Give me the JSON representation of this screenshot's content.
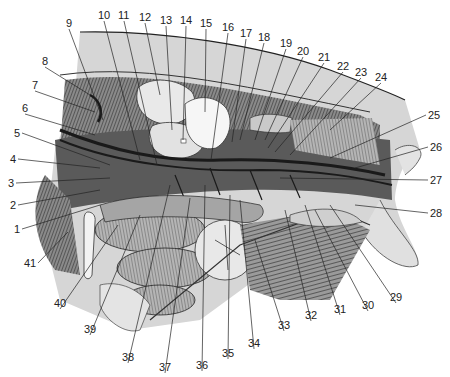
{
  "figure": {
    "type": "anatomical-illustration",
    "labels": [
      {
        "num": "1",
        "x": 14,
        "y": 224,
        "tx": 100,
        "ty": 205
      },
      {
        "num": "2",
        "x": 10,
        "y": 200,
        "tx": 100,
        "ty": 190
      },
      {
        "num": "3",
        "x": 8,
        "y": 178,
        "tx": 110,
        "ty": 178
      },
      {
        "num": "4",
        "x": 10,
        "y": 154,
        "tx": 100,
        "ty": 168
      },
      {
        "num": "5",
        "x": 14,
        "y": 128,
        "tx": 110,
        "ty": 165
      },
      {
        "num": "6",
        "x": 22,
        "y": 103,
        "tx": 95,
        "ty": 135
      },
      {
        "num": "7",
        "x": 32,
        "y": 80,
        "tx": 95,
        "ty": 112
      },
      {
        "num": "8",
        "x": 42,
        "y": 56,
        "tx": 90,
        "ty": 95
      },
      {
        "num": "9",
        "x": 66,
        "y": 18,
        "tx": 103,
        "ty": 120
      },
      {
        "num": "10",
        "x": 98,
        "y": 10,
        "tx": 140,
        "ty": 160
      },
      {
        "num": "11",
        "x": 118,
        "y": 10,
        "tx": 157,
        "ty": 165
      },
      {
        "num": "12",
        "x": 139,
        "y": 12,
        "tx": 160,
        "ty": 95
      },
      {
        "num": "13",
        "x": 160,
        "y": 15,
        "tx": 172,
        "ty": 130
      },
      {
        "num": "14",
        "x": 180,
        "y": 15,
        "tx": 183,
        "ty": 140
      },
      {
        "num": "15",
        "x": 200,
        "y": 18,
        "tx": 205,
        "ty": 112
      },
      {
        "num": "16",
        "x": 222,
        "y": 22,
        "tx": 211,
        "ty": 160
      },
      {
        "num": "17",
        "x": 240,
        "y": 28,
        "tx": 232,
        "ty": 142
      },
      {
        "num": "18",
        "x": 258,
        "y": 32,
        "tx": 240,
        "ty": 140
      },
      {
        "num": "19",
        "x": 280,
        "y": 38,
        "tx": 255,
        "ty": 140
      },
      {
        "num": "20",
        "x": 297,
        "y": 46,
        "tx": 265,
        "ty": 140
      },
      {
        "num": "21",
        "x": 318,
        "y": 52,
        "tx": 268,
        "ty": 148
      },
      {
        "num": "22",
        "x": 337,
        "y": 61,
        "tx": 275,
        "ty": 152
      },
      {
        "num": "23",
        "x": 355,
        "y": 67,
        "tx": 290,
        "ty": 155
      },
      {
        "num": "24",
        "x": 375,
        "y": 72,
        "tx": 330,
        "ty": 130
      },
      {
        "num": "25",
        "x": 428,
        "y": 110,
        "tx": 330,
        "ty": 158
      },
      {
        "num": "26",
        "x": 430,
        "y": 142,
        "tx": 355,
        "ty": 168
      },
      {
        "num": "27",
        "x": 430,
        "y": 175,
        "tx": 280,
        "ty": 178
      },
      {
        "num": "28",
        "x": 430,
        "y": 208,
        "tx": 355,
        "ty": 205
      },
      {
        "num": "29",
        "x": 390,
        "y": 292,
        "tx": 330,
        "ty": 205
      },
      {
        "num": "30",
        "x": 362,
        "y": 300,
        "tx": 315,
        "ty": 210
      },
      {
        "num": "31",
        "x": 334,
        "y": 304,
        "tx": 305,
        "ty": 205
      },
      {
        "num": "32",
        "x": 305,
        "y": 310,
        "tx": 285,
        "ty": 210
      },
      {
        "num": "33",
        "x": 278,
        "y": 320,
        "tx": 255,
        "ty": 240
      },
      {
        "num": "34",
        "x": 248,
        "y": 338,
        "tx": 240,
        "ty": 200
      },
      {
        "num": "35",
        "x": 222,
        "y": 348,
        "tx": 230,
        "ty": 195
      },
      {
        "num": "36",
        "x": 196,
        "y": 360,
        "tx": 205,
        "ty": 185
      },
      {
        "num": "37",
        "x": 159,
        "y": 362,
        "tx": 190,
        "ty": 198
      },
      {
        "num": "38",
        "x": 122,
        "y": 352,
        "tx": 170,
        "ty": 185
      },
      {
        "num": "39",
        "x": 84,
        "y": 324,
        "tx": 140,
        "ty": 215
      },
      {
        "num": "40",
        "x": 54,
        "y": 298,
        "tx": 118,
        "ty": 225
      },
      {
        "num": "41",
        "x": 24,
        "y": 258,
        "tx": 68,
        "ty": 232
      }
    ]
  },
  "colors": {
    "ink": "#222222",
    "muscle": "#6a6a6a",
    "muscle_dark": "#3a3a3a",
    "organ_light": "#e6e6e6",
    "organ_mid": "#b8b8b8",
    "skin": "#d9d9d9",
    "background": "#ffffff"
  }
}
